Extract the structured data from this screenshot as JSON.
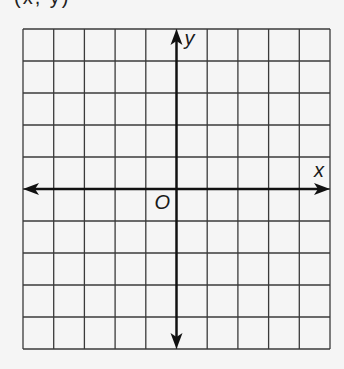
{
  "caption": "(x, y)",
  "grid": {
    "columns": 10,
    "rows": 10,
    "left": 23,
    "top": 29,
    "width": 307,
    "height": 320,
    "line_color": "#3a3a3a",
    "axis_color": "#111111",
    "background": "#f5f5f5"
  },
  "axes": {
    "x_label": "x",
    "y_label": "y",
    "origin_label": "O",
    "origin_col": 5,
    "origin_row": 5
  }
}
